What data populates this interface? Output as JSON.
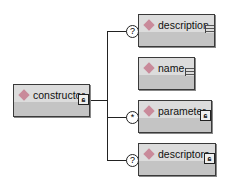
{
  "diagram": {
    "root": {
      "label": "constructor",
      "icon": "sequence-icon"
    },
    "children": [
      {
        "label": "description",
        "occurrence": "?",
        "icon": "text-content-icon"
      },
      {
        "label": "name",
        "occurrence": "",
        "icon": "text-content-icon"
      },
      {
        "label": "parameter",
        "occurrence": "*",
        "icon": "sequence-icon"
      },
      {
        "label": "descriptors",
        "occurrence": "?",
        "icon": "sequence-icon"
      }
    ],
    "colors": {
      "diamond": "#c98a9a",
      "box_top": "#dcdcdc",
      "box_bottom": "#c4c4c4",
      "border": "#3a3a3a"
    }
  }
}
